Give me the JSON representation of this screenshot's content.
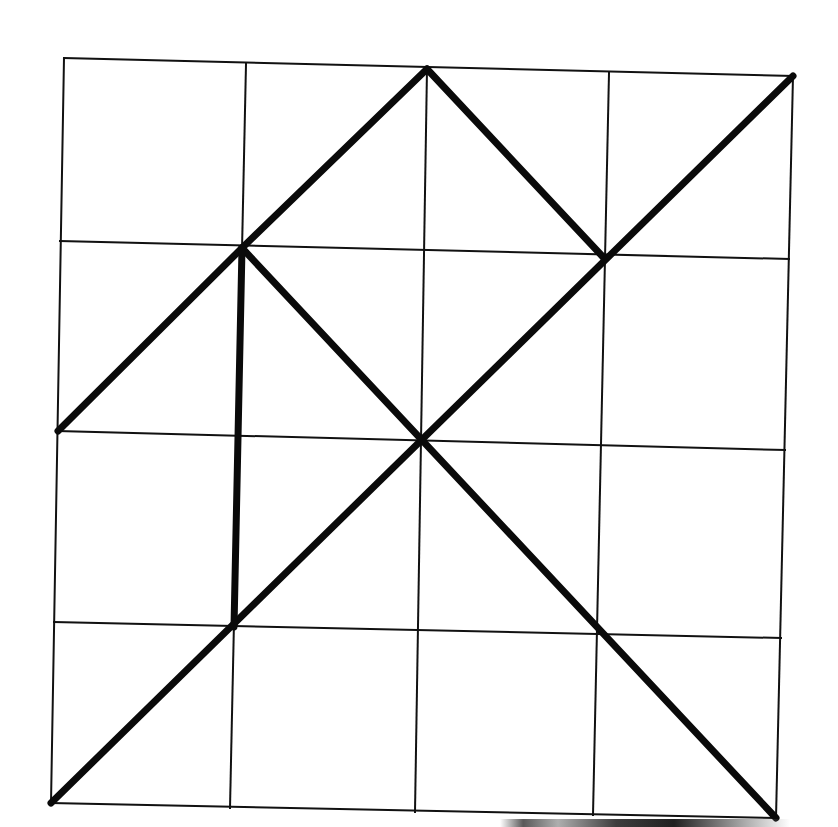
{
  "figure": {
    "grid": {
      "rows": 4,
      "cols": 4,
      "line_color": "#111111",
      "nodes": [
        [
          [
            64,
            58
          ],
          [
            246,
            64
          ],
          [
            427,
            69
          ],
          [
            609,
            73
          ],
          [
            793,
            76
          ]
        ],
        [
          [
            60,
            241
          ],
          [
            242,
            248
          ],
          [
            423,
            252
          ],
          [
            603,
            257
          ],
          [
            789,
            259
          ]
        ],
        [
          [
            58,
            431
          ],
          [
            237,
            438
          ],
          [
            421,
            440
          ],
          [
            600,
            446
          ],
          [
            785,
            450
          ]
        ],
        [
          [
            54,
            622
          ],
          [
            234,
            627
          ],
          [
            418,
            631
          ],
          [
            597,
            633
          ],
          [
            781,
            638
          ]
        ],
        [
          [
            51,
            803
          ],
          [
            230,
            808
          ],
          [
            415,
            812
          ],
          [
            593,
            815
          ],
          [
            776,
            818
          ]
        ]
      ]
    },
    "heavy_lines": {
      "color": "#0a0a0a",
      "segments": [
        {
          "name": "left-rising-segment",
          "from": [
            2,
            0
          ],
          "to": [
            1,
            1
          ]
        },
        {
          "name": "upper-rising-segment",
          "from": [
            1,
            1
          ],
          "to": [
            0,
            2
          ]
        },
        {
          "name": "top-falling-segment",
          "from": [
            0,
            2
          ],
          "to": [
            1,
            3
          ]
        },
        {
          "name": "anti-diagonal",
          "from": [
            0,
            4
          ],
          "to": [
            4,
            0
          ]
        },
        {
          "name": "long-falling-diagonal",
          "from": [
            1,
            1
          ],
          "to": [
            4,
            4
          ]
        },
        {
          "name": "vertical-segment",
          "from": [
            1,
            1
          ],
          "to": [
            3,
            1
          ]
        }
      ]
    }
  }
}
